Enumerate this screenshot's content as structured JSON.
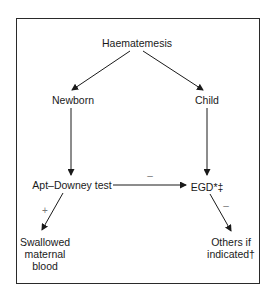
{
  "nodes": {
    "root": "Haematemesis",
    "newborn": "Newborn",
    "child": "Child",
    "apt": "Apt–Downey test",
    "egd": "EGD*‡",
    "swallowed": [
      "Swallowed",
      "maternal",
      "blood"
    ],
    "others": [
      "Others if",
      "indicated†"
    ]
  },
  "edges": {
    "apt_to_egd_sign": "–",
    "apt_to_swallowed_sign": "+",
    "egd_to_others_sign": "–"
  },
  "colors": {
    "line": "#1a1a1a",
    "frame": "#2a2a2a",
    "sign": "#777777"
  }
}
